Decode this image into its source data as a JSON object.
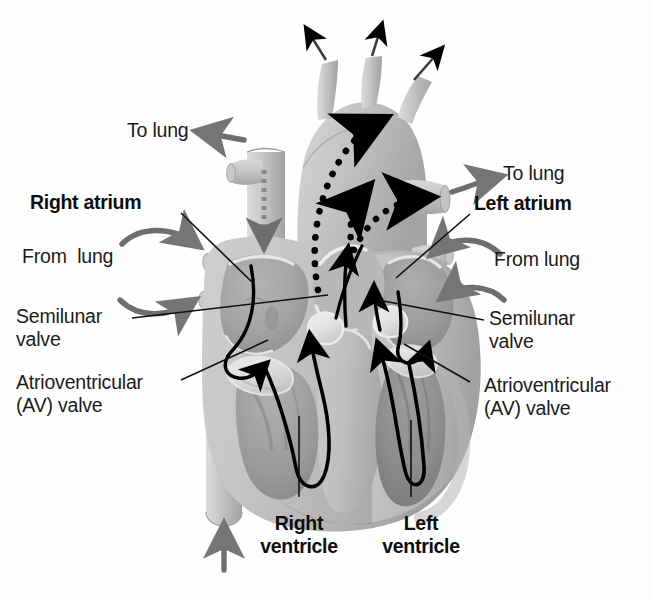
{
  "diagram": {
    "palette": {
      "background": "#ffffff",
      "text": "#1b1b1b",
      "leader_line": "#111111",
      "flow_arrow": "#000000",
      "vessel_arrow": "#6e6e6e",
      "muscle_light": "#d6d6d6",
      "muscle_mid": "#b9b9b9",
      "muscle_dark": "#9a9a9a",
      "chamber_shadow": "#8e8e8e",
      "vessel_light": "#cfcfcf",
      "valve_white": "#efefef"
    }
  },
  "labels": {
    "to_lung_left": "To lung",
    "to_lung_right": "To lung",
    "right_atrium": "Right atrium",
    "left_atrium": "Left atrium",
    "from_lung_left": "From  lung",
    "from_lung_right": "From lung",
    "semilunar_valve_left_line1": "Semilunar",
    "semilunar_valve_left_line2": "valve",
    "semilunar_valve_right_line1": "Semilunar",
    "semilunar_valve_right_line2": "valve",
    "av_valve_left_line1": "Atrioventricular",
    "av_valve_left_line2": "(AV) valve",
    "av_valve_right_line1": "Atrioventricular",
    "av_valve_right_line2": "(AV) valve",
    "right_ventricle_line1": "Right",
    "right_ventricle_line2": "ventricle",
    "left_ventricle_line1": "Left",
    "left_ventricle_line2": "ventricle"
  },
  "flow_arrows": {
    "aorta_outflow_1": "arrow-up-left-icon",
    "aorta_outflow_2": "arrow-up-icon",
    "aorta_outflow_3": "arrow-up-right-icon",
    "to_lung_left_arrow": "arrow-left-icon",
    "to_lung_right_arrow": "arrow-right-icon",
    "from_lung_left_arrow_upper": "curved-arrow-right-icon",
    "from_lung_left_arrow_lower": "curved-arrow-right-icon",
    "from_lung_right_arrow_upper": "curved-arrow-left-icon",
    "from_lung_right_arrow_lower": "curved-arrow-left-icon",
    "vena_cava_superior_inflow": "dashed-arrow-down-icon",
    "vena_cava_inferior_inflow": "arrow-up-icon",
    "aortic_arch_dotted_flow": "dotted-curved-arrow-icon",
    "pulmonary_trunk_dotted_flow": "dotted-curved-arrow-icon",
    "right_heart_flow": "u-turn-arrow-icon",
    "left_heart_flow": "u-turn-arrow-icon"
  }
}
